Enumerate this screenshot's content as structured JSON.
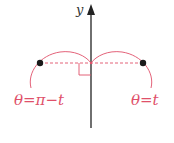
{
  "diagram": {
    "axis_label": "y",
    "left_label": "θ=π−t",
    "right_label": "θ=t",
    "colors": {
      "axis": "#222222",
      "curve": "#e0506a",
      "point": "#1a1a1a"
    }
  }
}
